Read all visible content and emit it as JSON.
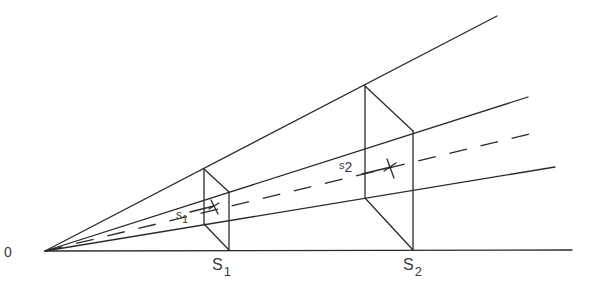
{
  "diagram": {
    "origin_label": "0",
    "frames": [
      {
        "id": "frame-1",
        "base_label": "S",
        "base_subscript": "1",
        "point_label": "s",
        "point_subscript": "1"
      },
      {
        "id": "frame-2",
        "base_label": "S",
        "base_subscript": "2",
        "point_label": "s",
        "point_subscript": "2"
      }
    ],
    "rays": [
      "top-ray",
      "upper-ray",
      "dashed-center-ray",
      "lower-ray",
      "baseline"
    ],
    "colors": {
      "stroke": "#2a2a2a",
      "text": "#3a3a3a",
      "background": "#ffffff"
    }
  }
}
